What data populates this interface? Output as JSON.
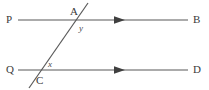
{
  "figure": {
    "type": "geometry-diagram",
    "background_color": "#ffffff",
    "line_color": "#595959",
    "text_color": "#3a3a3a",
    "width": 209,
    "height": 90
  },
  "lines": {
    "parallel_top": {
      "name": "PB",
      "start_label": "P",
      "end_label": "B",
      "x1": 18,
      "y1": 20,
      "x2": 188,
      "y2": 20,
      "arrow_marker": "single-arrow-right",
      "arrow_x": 120
    },
    "parallel_bottom": {
      "name": "QD",
      "start_label": "Q",
      "end_label": "D",
      "x1": 18,
      "y1": 70,
      "x2": 188,
      "y2": 70,
      "arrow_marker": "single-arrow-right",
      "arrow_x": 120
    },
    "transversal": {
      "name": "transversal",
      "x1": 29,
      "y1": 88,
      "x2": 88,
      "y2": 3
    }
  },
  "points": {
    "P": "P",
    "B": "B",
    "Q": "Q",
    "D": "D",
    "A": "A",
    "C": "C"
  },
  "angles": {
    "y": "y",
    "x": "x"
  }
}
